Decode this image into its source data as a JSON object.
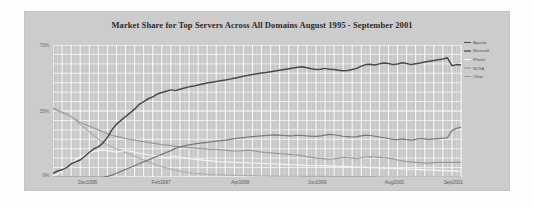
{
  "chart_data": {
    "type": "line",
    "title": "Market Share for Top Servers Across All Domains August 1995 - September 2001",
    "xlabel": "",
    "ylabel": "",
    "ylim": [
      0,
      70
    ],
    "yticks": [
      "0%",
      "35%",
      "70%"
    ],
    "ytick_values": [
      0,
      35,
      70
    ],
    "grid": true,
    "grid_color": "#ffffff",
    "plot_background": "#c8c8c8",
    "legend_position": "right",
    "xticks": [
      "Dec1995",
      "Feb1997",
      "Apr1998",
      "Jun1999",
      "Aug2000",
      "Sep2001"
    ],
    "xtick_positions": [
      0.088,
      0.268,
      0.462,
      0.65,
      0.838,
      0.982
    ],
    "x_start": "Aug1995",
    "x_end": "Sep2001",
    "series": [
      {
        "name": "Apache",
        "color": "#4a4a4a",
        "values": [
          2.0,
          3.2,
          3.8,
          5.0,
          7.0,
          8.0,
          9.0,
          11.0,
          13.0,
          15.0,
          16.0,
          18.0,
          21.0,
          25.0,
          28.0,
          30.0,
          32.0,
          34.0,
          36.0,
          38.5,
          40.0,
          41.5,
          42.5,
          44.0,
          44.8,
          45.5,
          46.2,
          45.8,
          46.5,
          47.2,
          47.8,
          48.2,
          48.8,
          49.3,
          49.8,
          50.2,
          50.6,
          51.0,
          51.4,
          51.9,
          52.4,
          52.9,
          53.4,
          53.9,
          54.3,
          54.7,
          55.1,
          55.4,
          55.8,
          56.2,
          56.6,
          57.0,
          57.4,
          57.8,
          58.2,
          58.5,
          57.9,
          57.4,
          57.0,
          57.2,
          57.6,
          57.2,
          57.0,
          56.6,
          56.3,
          56.5,
          57.0,
          57.6,
          58.8,
          59.6,
          59.8,
          59.4,
          60.0,
          60.4,
          60.2,
          59.6,
          59.9,
          60.6,
          60.2,
          59.6,
          60.0,
          60.4,
          61.0,
          61.4,
          61.8,
          62.2,
          62.6,
          63.2,
          59.0,
          59.6,
          59.4
        ]
      },
      {
        "name": "Microsoft",
        "color": "#777777",
        "values": [
          0.0,
          0.0,
          0.0,
          0.0,
          0.0,
          0.0,
          0.0,
          0.0,
          0.0,
          0.0,
          0.0,
          0.0,
          0.3,
          1.0,
          2.0,
          3.0,
          4.0,
          5.0,
          6.0,
          7.0,
          8.0,
          9.0,
          10.0,
          11.0,
          12.0,
          13.0,
          14.0,
          15.2,
          16.0,
          16.5,
          17.0,
          17.4,
          17.8,
          18.1,
          18.4,
          18.7,
          19.0,
          19.3,
          19.6,
          20.0,
          20.3,
          20.6,
          20.9,
          21.2,
          21.4,
          21.6,
          21.8,
          22.0,
          22.2,
          22.3,
          22.2,
          22.0,
          21.8,
          21.9,
          22.1,
          22.0,
          21.8,
          21.6,
          21.5,
          21.8,
          22.2,
          22.6,
          22.4,
          22.0,
          21.6,
          21.4,
          21.2,
          21.4,
          21.8,
          22.2,
          22.0,
          21.6,
          21.2,
          20.8,
          20.4,
          20.0,
          19.8,
          20.2,
          19.8,
          19.6,
          20.0,
          20.4,
          20.2,
          20.0,
          20.2,
          20.4,
          20.6,
          20.8,
          24.6,
          25.8,
          26.4
        ]
      },
      {
        "name": "iPlanet",
        "color": "#f4f4f4",
        "values": [
          0.5,
          1.5,
          3.0,
          5.0,
          7.0,
          9.0,
          10.5,
          11.5,
          12.5,
          13.5,
          14.0,
          14.2,
          14.0,
          13.6,
          13.2,
          13.6,
          14.2,
          13.8,
          13.2,
          12.6,
          12.2,
          11.8,
          11.4,
          11.0,
          10.6,
          10.2,
          10.6,
          11.0,
          10.6,
          10.2,
          9.8,
          9.5,
          9.2,
          8.9,
          8.7,
          8.5,
          8.3,
          8.1,
          8.0,
          7.9,
          7.8,
          7.7,
          7.6,
          7.5,
          7.4,
          7.3,
          7.2,
          7.1,
          7.0,
          6.9,
          6.8,
          6.7,
          6.6,
          6.5,
          6.4,
          6.3,
          6.2,
          6.1,
          6.1,
          6.0,
          6.0,
          5.9,
          5.8,
          5.7,
          5.6,
          5.5,
          5.4,
          5.3,
          5.2,
          5.1,
          5.0,
          4.9,
          4.8,
          4.7,
          4.6,
          4.5,
          4.4,
          4.3,
          4.2,
          4.1,
          4.0,
          3.9,
          3.8,
          3.7,
          3.6,
          3.5,
          3.4,
          3.3,
          3.2,
          3.1,
          3.0
        ]
      },
      {
        "name": "NCSA",
        "color": "#b0b0b0",
        "values": [
          36.0,
          35.0,
          34.0,
          33.0,
          32.0,
          30.0,
          28.0,
          26.0,
          24.0,
          22.0,
          20.0,
          18.5,
          17.0,
          16.0,
          15.0,
          14.0,
          13.0,
          12.0,
          11.0,
          10.0,
          9.0,
          8.0,
          7.0,
          6.2,
          5.5,
          4.8,
          4.2,
          3.6,
          3.1,
          2.7,
          2.3,
          2.0,
          1.8,
          1.6,
          1.4,
          1.3,
          1.2,
          1.1,
          1.0,
          0.9,
          0.9,
          0.8,
          0.8,
          0.7,
          0.7,
          0.6,
          0.6,
          0.6,
          0.5,
          0.5,
          0.5,
          0.4,
          0.4,
          0.4,
          0.4,
          0.3,
          0.3,
          0.3,
          0.3,
          0.3,
          0.3,
          0.2,
          0.2,
          0.2,
          0.2,
          0.2,
          0.2,
          0.2,
          0.2,
          0.2,
          0.2,
          0.2,
          0.1,
          0.1,
          0.1,
          0.1,
          0.1,
          0.1,
          0.1,
          0.1,
          0.1,
          0.1,
          0.1,
          0.1,
          0.1,
          0.1,
          0.1,
          0.1,
          0.1,
          0.1,
          0.1
        ]
      },
      {
        "name": "Other",
        "color": "#9a9a9a",
        "values": [
          36.5,
          35.5,
          34.5,
          33.5,
          32.0,
          30.5,
          29.0,
          28.0,
          27.0,
          26.0,
          25.0,
          24.0,
          23.0,
          22.0,
          21.5,
          21.0,
          20.5,
          20.0,
          19.6,
          19.2,
          18.8,
          18.4,
          18.0,
          17.6,
          17.2,
          17.0,
          16.6,
          16.2,
          16.0,
          15.8,
          15.6,
          15.4,
          15.2,
          15.0,
          14.8,
          14.6,
          14.6,
          14.4,
          14.2,
          14.0,
          13.8,
          13.8,
          14.0,
          14.2,
          14.0,
          13.6,
          13.2,
          13.0,
          12.8,
          12.6,
          12.4,
          12.2,
          12.0,
          11.8,
          11.6,
          11.2,
          10.8,
          10.4,
          10.0,
          9.8,
          9.6,
          9.4,
          9.6,
          10.0,
          10.4,
          10.2,
          10.0,
          9.8,
          10.2,
          10.6,
          10.8,
          10.6,
          10.4,
          10.2,
          10.0,
          9.6,
          9.0,
          8.6,
          8.2,
          8.0,
          7.8,
          7.6,
          7.4,
          7.4,
          7.6,
          7.8,
          7.8,
          7.8,
          7.8,
          7.8,
          7.8
        ]
      }
    ]
  },
  "legend": {
    "items": [
      {
        "label": "Apache",
        "color": "#4a4a4a"
      },
      {
        "label": "Microsoft",
        "color": "#777777"
      },
      {
        "label": "iPlanet",
        "color": "#f4f4f4"
      },
      {
        "label": "NCSA",
        "color": "#b0b0b0"
      },
      {
        "label": "Other",
        "color": "#9a9a9a"
      }
    ]
  }
}
